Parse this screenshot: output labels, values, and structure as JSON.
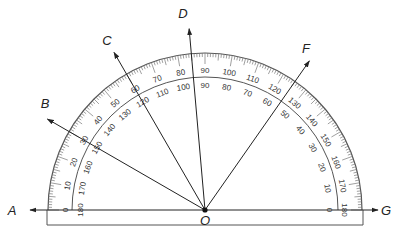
{
  "diagram": {
    "center": {
      "name": "O",
      "x": 205,
      "y": 210
    },
    "outer_radius": 157,
    "inner_radius": 133,
    "colors": {
      "line": "#333333",
      "scale": "#555555",
      "tick": "#777777"
    },
    "baseline": {
      "left_point": {
        "name": "A",
        "x": 12,
        "label_x": 12,
        "label_y": 215
      },
      "right_point": {
        "name": "G",
        "x": 392,
        "label_x": 386,
        "label_y": 215
      }
    },
    "rays": [
      {
        "name": "B",
        "angle": 150,
        "label_x": 45,
        "label_y": 108
      },
      {
        "name": "C",
        "angle": 120,
        "label_x": 107,
        "label_y": 45
      },
      {
        "name": "D",
        "angle": 95,
        "label_x": 183,
        "label_y": 18
      },
      {
        "name": "F",
        "angle": 55,
        "label_x": 306,
        "label_y": 53
      }
    ],
    "outer_scale": [
      "0",
      "10",
      "20",
      "30",
      "40",
      "50",
      "60",
      "70",
      "80",
      "90",
      "100",
      "110",
      "120",
      "130",
      "140",
      "150",
      "160",
      "170",
      "180"
    ],
    "inner_scale": [
      "180",
      "170",
      "160",
      "150",
      "140",
      "130",
      "120",
      "110",
      "100",
      "90",
      "80",
      "70",
      "60",
      "50",
      "40",
      "30",
      "20",
      "10",
      "0"
    ]
  }
}
